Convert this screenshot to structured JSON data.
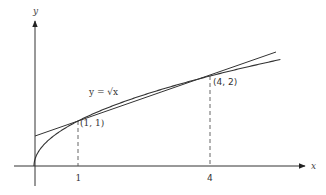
{
  "diagram": {
    "axes": {
      "x_label": "x",
      "y_label": "y"
    },
    "ticks": [
      {
        "label": "1",
        "x": 1
      },
      {
        "label": "4",
        "x": 4
      }
    ],
    "curve_label": "y = √x",
    "points": [
      {
        "label": "(1, 1)",
        "x": 1,
        "y": 1
      },
      {
        "label": "(4, 2)",
        "x": 4,
        "y": 2
      }
    ],
    "curve": {
      "function": "sqrt(x)",
      "x_range": [
        0,
        5.6
      ]
    },
    "secant_line": {
      "function": "(x + 2) / 3",
      "x_range": [
        0,
        5.6
      ],
      "through": [
        "(1, 1)",
        "(4, 2)"
      ]
    },
    "colors": {
      "stroke": "#333333",
      "background": "#ffffff"
    }
  }
}
